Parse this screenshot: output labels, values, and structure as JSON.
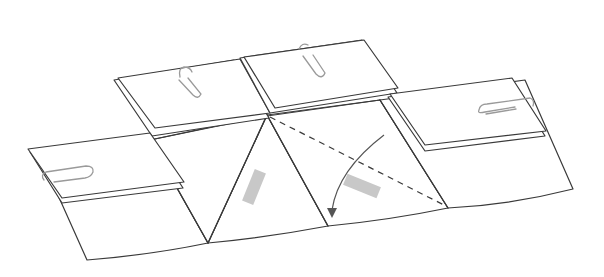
{
  "figure": {
    "type": "line-drawing",
    "colors": {
      "line": "#3a3a3a",
      "clip": "#9a9a9a",
      "tape": "#c8c8c8",
      "background": "#ffffff"
    },
    "panels": [
      {
        "name": "left-flap",
        "clip_orientation": "horizontal"
      },
      {
        "name": "top-left-flap",
        "clip_orientation": "vertical"
      },
      {
        "name": "top-right-flap",
        "clip_orientation": "vertical"
      },
      {
        "name": "right-flap",
        "clip_orientation": "horizontal"
      }
    ],
    "fold_elements": {
      "left_triangle_tape": "tape strip",
      "right_triangle_tape": "tape strip",
      "dashed_fold_line": "valley fold indicator",
      "arrow": "curved fold-direction arrow"
    }
  }
}
